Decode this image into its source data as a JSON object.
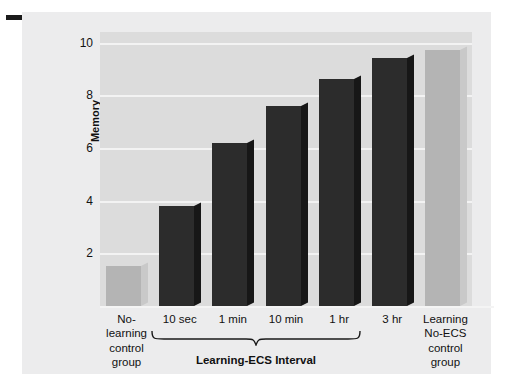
{
  "figure": {
    "corner_dash": "dash-mark"
  },
  "chart_data": {
    "type": "bar",
    "title": "",
    "xlabel": "Learning-ECS Interval",
    "ylabel": "Memory (mean niche explorations)",
    "ylabel_main": "Memory",
    "ylabel_sub": "(mean niche explorations)",
    "ylim": [
      0,
      10.4
    ],
    "yticks": [
      2,
      4,
      6,
      8,
      10
    ],
    "ytick_labels": [
      "2",
      "4",
      "6",
      "8",
      "10"
    ],
    "grid": true,
    "legend": "none",
    "categories": [
      "No-learning control group",
      "10 sec",
      "1 min",
      "10 min",
      "1 hr",
      "3 hr",
      "Learning No-ECS control group"
    ],
    "category_lines": [
      [
        "No-",
        "learning",
        "control",
        "group"
      ],
      [
        "10 sec"
      ],
      [
        "1 min"
      ],
      [
        "10 min"
      ],
      [
        "1 hr"
      ],
      [
        "3 hr"
      ],
      [
        "Learning",
        "No-ECS",
        "control",
        "group"
      ]
    ],
    "values": [
      1.5,
      3.8,
      6.2,
      7.6,
      8.6,
      9.4,
      9.7
    ],
    "bar_styles": [
      "light",
      "dark",
      "dark",
      "dark",
      "dark",
      "dark",
      "light"
    ],
    "group_bracket": {
      "label": "Learning-ECS Interval",
      "covers": [
        "10 sec",
        "1 min",
        "10 min",
        "1 hr",
        "3 hr"
      ]
    },
    "colors": {
      "bar_dark_front": "#2c2c2c",
      "bar_dark_side": "#171717",
      "bar_light_front": "#b4b4b4",
      "bar_light_side": "#c9c9c9",
      "plot_background": "#dcdcdc",
      "gridline": "#f3f3f3",
      "panel_background": "#ececed",
      "text": "#111111"
    }
  }
}
